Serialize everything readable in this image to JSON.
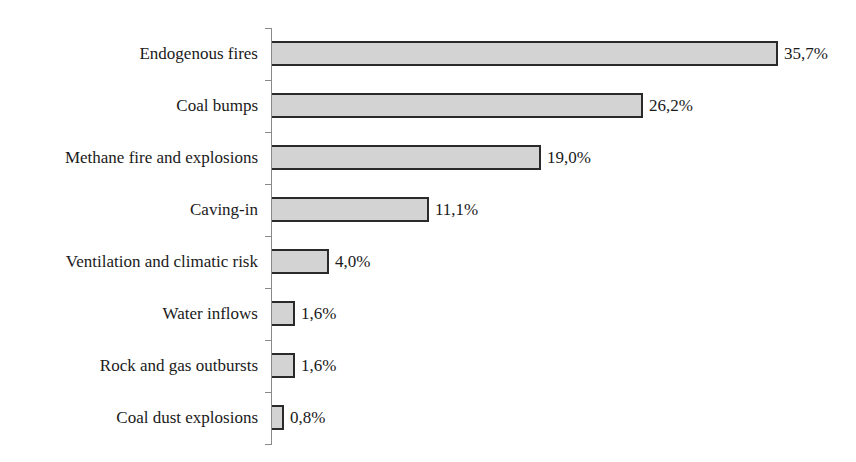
{
  "chart_data": {
    "type": "bar",
    "orientation": "horizontal",
    "title": "",
    "xlabel": "",
    "ylabel": "",
    "categories": [
      "Endogenous fires",
      "Coal bumps",
      "Methane fire and explosions",
      "Caving-in",
      "Ventilation and climatic risk",
      "Water inflows",
      "Rock and gas outbursts",
      "Coal dust explosions"
    ],
    "values": [
      35.7,
      26.2,
      19.0,
      11.1,
      4.0,
      1.6,
      1.6,
      0.8
    ],
    "value_labels": [
      "35,7%",
      "26,2%",
      "19,0%",
      "11,1%",
      "4,0%",
      "1,6%",
      "1,6%",
      "0,8%"
    ],
    "unit": "%",
    "xlim": [
      0,
      35.7
    ],
    "grid": false,
    "legend": null,
    "bar_color": "#d3d3d3",
    "bar_edge_color": "#2a2a2a"
  }
}
